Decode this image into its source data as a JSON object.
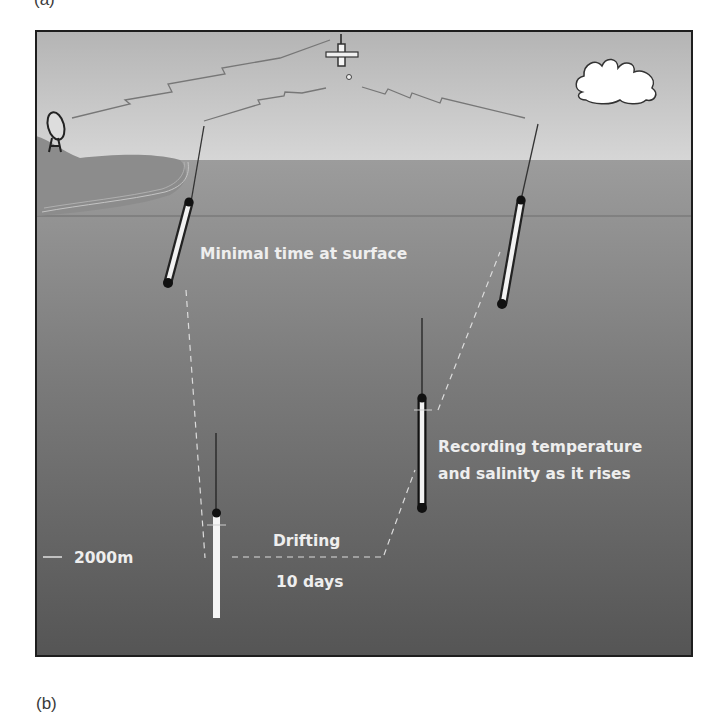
{
  "figure": {
    "panel_label_top": "(a)",
    "panel_label_bottom": "(b)",
    "labels": {
      "surface": "Minimal time at surface",
      "rising_line1": "Recording temperature",
      "rising_line2": "and salinity as it rises",
      "drifting": "Drifting",
      "duration": "10 days",
      "depth": "2000m"
    },
    "elements": [
      "satellite",
      "ground-station-dish",
      "cloud",
      "coastline",
      "float-surface-left",
      "float-surface-right",
      "float-drifting",
      "float-rising"
    ],
    "colors": {
      "sky_top": "#b9b9b9",
      "sky_bottom": "#d4d4d4",
      "sea_top": "#999999",
      "sea_bottom": "#595959",
      "land": "#8a8a8a",
      "frame": "#1e1e1e",
      "text": "#eeeeee"
    }
  }
}
